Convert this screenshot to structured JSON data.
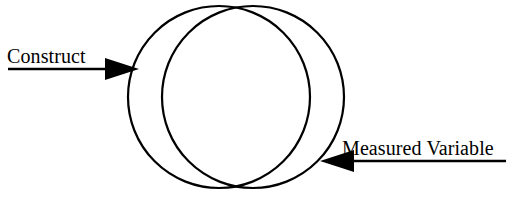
{
  "diagram": {
    "type": "venn-overlap",
    "background_color": "#ffffff",
    "stroke_color": "#000000",
    "labels": {
      "construct": "Construct",
      "measured_variable": "Measured Variable"
    },
    "shapes": {
      "left_circle": {
        "name": "construct-circle",
        "cx": 219,
        "cy": 97,
        "r": 91,
        "stroke_width": 2.2
      },
      "right_circle": {
        "name": "measured-variable-circle",
        "cx": 253,
        "cy": 97,
        "r": 91,
        "stroke_width": 2.2
      }
    },
    "arrows": {
      "construct_arrow": {
        "name": "construct-arrow",
        "direction": "right",
        "line_x1": 8,
        "line_x2": 122,
        "line_y": 69,
        "tip_x": 139,
        "head_half_height": 11,
        "head_length": 34,
        "stroke_width": 2.4
      },
      "measured_variable_arrow": {
        "name": "measured-variable-arrow",
        "direction": "left",
        "line_x1": 506,
        "line_x2": 339,
        "line_y": 161,
        "tip_x": 320,
        "head_half_height": 11,
        "head_length": 34,
        "stroke_width": 2.4
      }
    }
  }
}
